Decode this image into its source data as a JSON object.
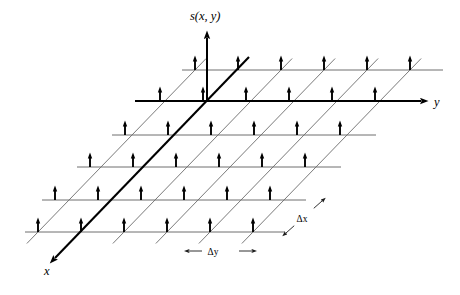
{
  "figure": {
    "background_color": "#ffffff",
    "width": 460,
    "height": 295
  },
  "axes": [
    {
      "id": "s-axis",
      "label": "s(x, y)",
      "label_x": 190,
      "label_y": 20,
      "direction": "up",
      "from": [
        207,
        101
      ],
      "to": [
        207,
        38
      ],
      "bold": true,
      "color": "#000000"
    },
    {
      "id": "y-axis",
      "label": "y",
      "label_x": 434,
      "label_y": 106,
      "direction": "right",
      "from": [
        135,
        101
      ],
      "to": [
        421,
        101
      ],
      "bold": true,
      "color": "#000000"
    },
    {
      "id": "x-axis",
      "label": "x",
      "label_x": 44,
      "label_y": 275,
      "direction": "down-left",
      "from": [
        249,
        57
      ],
      "to": [
        55,
        258
      ],
      "bold": true,
      "color": "#000000"
    }
  ],
  "grid": {
    "rows": 6,
    "cols": 6,
    "row_y": [
      70,
      101,
      135,
      167,
      200,
      232
    ],
    "row_x_start": [
      182,
      147,
      112,
      77,
      42,
      25
    ],
    "row_x_end": [
      443,
      411,
      376,
      341,
      306,
      285
    ],
    "row_origin_x": [
      242,
      207,
      172,
      137,
      102,
      67
    ],
    "col_spacing": 43,
    "row_rise": 32.4,
    "row_run": -35,
    "diagonal_top_y": 57,
    "diagonal_bottom_y": 245,
    "line_color_horizontal": "#6e6e6e",
    "line_color_diagonal": "#7a7a7a",
    "bold_row_index": 1,
    "bold_diagonal_index": 1
  },
  "samples": {
    "stem_height": 13,
    "head_width": 4.4,
    "head_height": 6.0,
    "color": "#000000",
    "count_per_row": 6,
    "description": "vertical impulse arrow at each lattice intersection"
  },
  "measures": [
    {
      "id": "delta-x",
      "label": "Δx",
      "label_x": 302,
      "label_y": 222,
      "from": [
        286,
        233
      ],
      "to": [
        322,
        201
      ],
      "arrow_both_ends": true
    },
    {
      "id": "delta-y",
      "label": "Δy",
      "label_x": 213,
      "label_y": 255,
      "from": [
        189,
        251
      ],
      "to": [
        252,
        251
      ],
      "arrow_both_ends": true
    }
  ],
  "labels": {
    "function_label": "s(x, y)",
    "x_axis_label": "x",
    "y_axis_label": "y",
    "delta_x_label": "Δx",
    "delta_y_label": "Δy"
  }
}
